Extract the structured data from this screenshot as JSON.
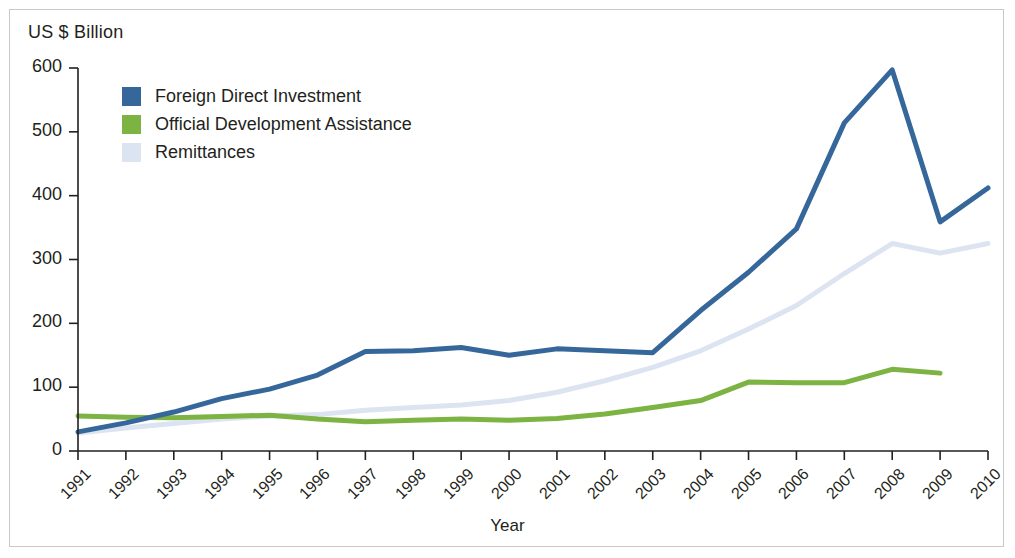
{
  "figure": {
    "unit_label": "US $ Billion",
    "x_axis_title": "Year"
  },
  "legend": {
    "items": [
      {
        "label": "Foreign Direct Investment",
        "color": "#36679b",
        "swatch": "legend-swatch-fdi"
      },
      {
        "label": "Official Development Assistance",
        "color": "#7cb342",
        "swatch": "legend-swatch-oda"
      },
      {
        "label": "Remittances",
        "color": "#dde4f1",
        "swatch": "legend-swatch-remittances"
      }
    ]
  },
  "chart_data": {
    "type": "line",
    "title": "",
    "subtitle": "",
    "xlabel": "Year",
    "ylabel": "US $ Billion",
    "ylim": [
      0,
      600
    ],
    "yticks": [
      0,
      100,
      200,
      300,
      400,
      500,
      600
    ],
    "ytick_labels": [
      "0",
      "100",
      "200",
      "300",
      "400",
      "500",
      "600"
    ],
    "grid": false,
    "legend_position": "top-left",
    "x": [
      1991,
      1992,
      1993,
      1994,
      1995,
      1996,
      1997,
      1998,
      1999,
      2000,
      2001,
      2002,
      2003,
      2004,
      2005,
      2006,
      2007,
      2008,
      2009,
      2010
    ],
    "xtick_labels": [
      "1991",
      "1992",
      "1993",
      "1994",
      "1995",
      "1996",
      "1997",
      "1998",
      "1999",
      "2000",
      "2001",
      "2002",
      "2003",
      "2004",
      "2005",
      "2006",
      "2007",
      "2008",
      "2009",
      "2010"
    ],
    "series": [
      {
        "name": "Foreign Direct Investment",
        "color": "#36679b",
        "width": 5,
        "values": [
          30,
          44,
          61,
          82,
          97,
          119,
          156,
          157,
          162,
          150,
          160,
          157,
          154,
          220,
          280,
          348,
          514,
          597,
          359,
          412
        ]
      },
      {
        "name": "Official Development Assistance",
        "color": "#7cb342",
        "width": 5,
        "values": [
          55,
          53,
          52,
          54,
          56,
          50,
          46,
          48,
          50,
          48,
          51,
          58,
          68,
          79,
          108,
          107,
          107,
          128,
          122,
          null
        ]
      },
      {
        "name": "Remittances",
        "color": "#dde4f1",
        "width": 5,
        "values": [
          28,
          36,
          43,
          50,
          55,
          57,
          64,
          68,
          72,
          79,
          92,
          110,
          131,
          157,
          191,
          228,
          278,
          325,
          310,
          325
        ]
      }
    ]
  },
  "axes": {
    "y_axis_name": "y-axis",
    "x_axis_name": "x-axis"
  }
}
